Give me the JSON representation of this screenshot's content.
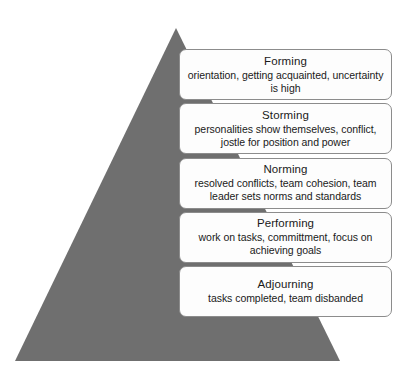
{
  "diagram": {
    "type": "pyramid-stages",
    "shape": {
      "name": "gray-triangle",
      "color": "#6f6f6f"
    },
    "stages": [
      {
        "title": "Forming",
        "description": "orientation, getting acquainted, uncertainty is high"
      },
      {
        "title": "Storming",
        "description": "personalities show themselves, conflict, jostle for position and power"
      },
      {
        "title": "Norming",
        "description": "resolved conflicts, team cohesion, team leader sets norms and standards"
      },
      {
        "title": "Performing",
        "description": "work on tasks, committment, focus on achieving goals"
      },
      {
        "title": "Adjourning",
        "description": "tasks completed, team disbanded"
      }
    ]
  }
}
